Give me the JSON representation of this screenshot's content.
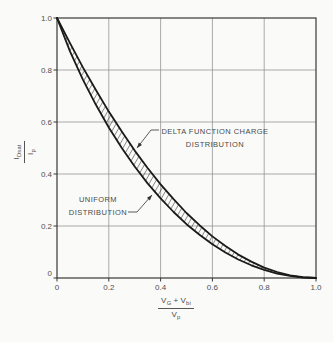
{
  "figure": {
    "background": "#fafaf8",
    "annotations": {
      "delta": {
        "line1": "DELTA FUNCTION CHARGE",
        "line2": "DISTRIBUTION"
      },
      "uniform": {
        "line1": "UNIFORM",
        "line2": "DISTRIBUTION"
      }
    },
    "ylabel": {
      "num_base": "I",
      "num_sub": "Dsat",
      "den_base": "I",
      "den_sub": "p"
    },
    "xlabel": {
      "num_v1": "V",
      "num_s1": "G",
      "plus": "+",
      "num_v2": "V",
      "num_s2": "bi",
      "den_base": "V",
      "den_sub": "p"
    }
  },
  "chart_data": {
    "type": "line",
    "title": "",
    "xlabel": "(V_G + V_bi) / V_p",
    "ylabel": "I_Dsat / I_p",
    "xlim": [
      0,
      1.0
    ],
    "ylim": [
      0,
      1.0
    ],
    "grid": true,
    "x": [
      0,
      0.05,
      0.1,
      0.15,
      0.2,
      0.25,
      0.3,
      0.35,
      0.4,
      0.45,
      0.5,
      0.55,
      0.6,
      0.65,
      0.7,
      0.75,
      0.8,
      0.85,
      0.9,
      0.95,
      1.0
    ],
    "series": [
      {
        "name": "DELTA FUNCTION CHARGE DISTRIBUTION",
        "values": [
          1.0,
          0.903,
          0.81,
          0.723,
          0.64,
          0.563,
          0.49,
          0.423,
          0.36,
          0.303,
          0.25,
          0.203,
          0.16,
          0.123,
          0.09,
          0.063,
          0.04,
          0.023,
          0.01,
          0.003,
          0.0
        ]
      },
      {
        "name": "UNIFORM DISTRIBUTION",
        "values": [
          1.0,
          0.872,
          0.763,
          0.666,
          0.579,
          0.5,
          0.429,
          0.364,
          0.306,
          0.254,
          0.207,
          0.166,
          0.13,
          0.098,
          0.071,
          0.049,
          0.031,
          0.017,
          0.008,
          0.002,
          0.0
        ]
      }
    ],
    "band": "hatched region between the two curves",
    "x_ticks": {
      "values": [
        0,
        0.2,
        0.4,
        0.6,
        0.8,
        1.0
      ],
      "labels": [
        "0",
        "0.2",
        "0.4",
        "0.6",
        "0.8",
        "1.0"
      ]
    },
    "y_ticks": {
      "values": [
        0,
        0.2,
        0.4,
        0.6,
        0.8,
        1.0
      ],
      "labels": [
        "0",
        "0.2",
        "0.4",
        "0.6",
        "0.8",
        "1.0"
      ]
    },
    "legend_position": "inline-annotations",
    "colors": {
      "curve": "#1a1a1a",
      "grid": "#8f8f8f",
      "frame": "#383838",
      "text": "#4f4f4f",
      "leader": "#4a4a4a"
    }
  }
}
